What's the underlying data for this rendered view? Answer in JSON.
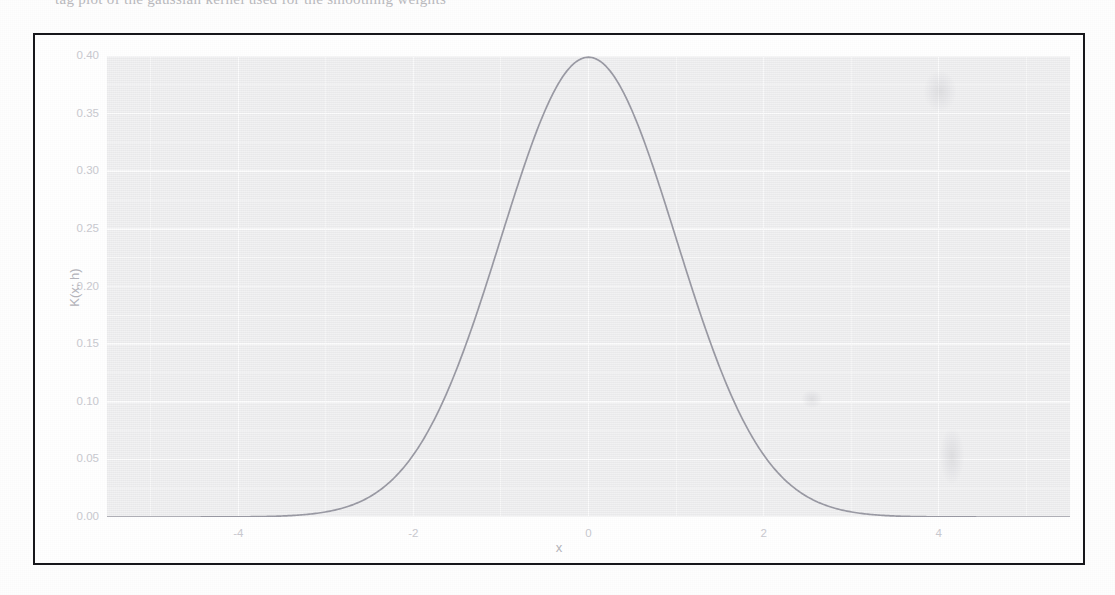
{
  "figure": {
    "caption_sliver": "tag plot of the gaussian kernel used for the smoothing weights",
    "panel_background": "#f4f4f5",
    "grid_color": "#ffffff",
    "curve_color": "#9a9aa4",
    "frame_color": "#16161a"
  },
  "axes": {
    "x_title": "x",
    "y_title": "K(x; h)",
    "x_ticks": [
      "-4",
      "-2",
      "0",
      "2",
      "4"
    ],
    "y_ticks": [
      "0.00",
      "0.05",
      "0.10",
      "0.15",
      "0.20",
      "0.25",
      "0.30",
      "0.35",
      "0.40"
    ]
  },
  "chart_data": {
    "type": "line",
    "title": "",
    "subtitle": "",
    "xlabel": "x",
    "ylabel": "K(x; h)",
    "xlim": [
      -5.5,
      5.5
    ],
    "ylim": [
      0.0,
      0.4
    ],
    "grid": true,
    "legend": null,
    "x_ticks": [
      -4,
      -2,
      0,
      2,
      4
    ],
    "y_ticks": [
      0.0,
      0.05,
      0.1,
      0.15,
      0.2,
      0.25,
      0.3,
      0.35,
      0.4
    ],
    "x_minor_ticks": [
      -5,
      -3,
      -1,
      1,
      3,
      5
    ],
    "y_minor_ticks": [
      0.025,
      0.075,
      0.125,
      0.175,
      0.225,
      0.275,
      0.325,
      0.375
    ],
    "series": [
      {
        "name": "Gaussian kernel K(x; h)",
        "color": "#9a9aa4",
        "x": [
          -5.5,
          -5.25,
          -5.0,
          -4.75,
          -4.5,
          -4.25,
          -4.0,
          -3.75,
          -3.5,
          -3.25,
          -3.0,
          -2.75,
          -2.5,
          -2.25,
          -2.0,
          -1.75,
          -1.5,
          -1.25,
          -1.0,
          -0.75,
          -0.5,
          -0.25,
          0.0,
          0.25,
          0.5,
          0.75,
          1.0,
          1.25,
          1.5,
          1.75,
          2.0,
          2.25,
          2.5,
          2.75,
          3.0,
          3.25,
          3.5,
          3.75,
          4.0,
          4.25,
          4.5,
          4.75,
          5.0,
          5.25,
          5.5
        ],
        "y": [
          0.0,
          0.0,
          0.0,
          0.0,
          0.0,
          0.0001,
          0.0001,
          0.0004,
          0.0009,
          0.002,
          0.0044,
          0.0091,
          0.0175,
          0.0317,
          0.054,
          0.0863,
          0.1295,
          0.1826,
          0.242,
          0.3011,
          0.3521,
          0.3867,
          0.3989,
          0.3867,
          0.3521,
          0.3011,
          0.242,
          0.1826,
          0.1295,
          0.0863,
          0.054,
          0.0317,
          0.0175,
          0.0091,
          0.0044,
          0.002,
          0.0009,
          0.0004,
          0.0001,
          0.0001,
          0.0,
          0.0,
          0.0,
          0.0,
          0.0
        ]
      }
    ],
    "annotations": []
  }
}
